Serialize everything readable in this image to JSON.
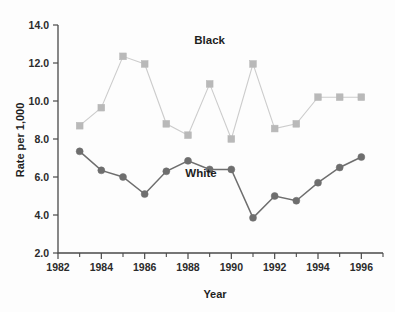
{
  "chart_data": {
    "type": "line",
    "title": "",
    "xlabel": "Year",
    "ylabel": "Rate per 1,000",
    "xlim": [
      1982,
      1997
    ],
    "ylim": [
      2.0,
      14.0
    ],
    "grid": false,
    "legend_position": "inline-annotation",
    "x_ticks": [
      "1982",
      "1984",
      "1986",
      "1988",
      "1990",
      "1992",
      "1994",
      "1996"
    ],
    "x_tick_values": [
      1982,
      1984,
      1986,
      1988,
      1990,
      1992,
      1994,
      1996
    ],
    "x_minor_tick_values": [
      1983,
      1985,
      1987,
      1989,
      1991,
      1993,
      1995,
      1997
    ],
    "y_ticks": [
      "14.0",
      "12.0",
      "10.0",
      "8.0",
      "6.0",
      "4.0",
      "2.0"
    ],
    "y_tick_values": [
      14.0,
      12.0,
      10.0,
      8.0,
      6.0,
      4.0,
      2.0
    ],
    "x": [
      1983,
      1984,
      1985,
      1986,
      1987,
      1988,
      1989,
      1990,
      1991,
      1992,
      1993,
      1994,
      1995,
      1996
    ],
    "series": [
      {
        "name": "Black",
        "marker": "square",
        "color": "#b9b9b9",
        "line_color": "#cccccc",
        "label_x": 1989.0,
        "label_y": 13.0,
        "values": [
          8.7,
          9.65,
          12.35,
          11.95,
          8.8,
          8.2,
          10.9,
          8.0,
          11.95,
          8.55,
          8.8,
          10.2,
          10.2,
          10.2
        ]
      },
      {
        "name": "White",
        "marker": "circle",
        "color": "#6e6e6e",
        "line_color": "#6e6e6e",
        "label_x": 1988.6,
        "label_y": 6.0,
        "values": [
          7.35,
          6.35,
          6.0,
          5.1,
          6.3,
          6.85,
          6.4,
          6.4,
          3.85,
          5.0,
          4.75,
          5.7,
          6.5,
          7.05
        ]
      }
    ]
  },
  "axes": {
    "y_axis_title": "Rate per 1,000",
    "x_axis_title": "Year"
  }
}
